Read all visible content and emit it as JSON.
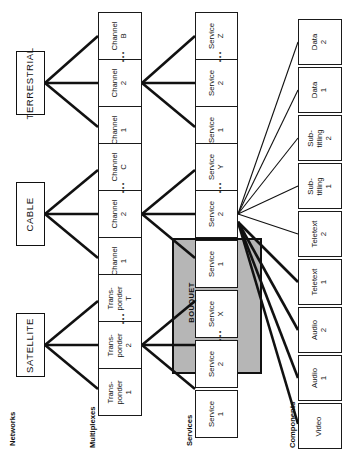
{
  "diagram": {
    "orientation": "rotated-90",
    "colors": {
      "line": "#111111",
      "box_fill": "#ffffff",
      "bouquet_fill": "#b6b6b6",
      "text": "#111111"
    }
  },
  "captions": [
    {
      "id": "networks",
      "label": "Networks"
    },
    {
      "id": "multiplexes",
      "label": "Multiplexes"
    },
    {
      "id": "services",
      "label": "Services"
    },
    {
      "id": "components",
      "label": "Components"
    }
  ],
  "bouquet": {
    "label": "BOUQUET"
  },
  "networks": [
    {
      "id": "terrestrial",
      "label": "TERRESTRIAL"
    },
    {
      "id": "cable",
      "label": "CABLE"
    },
    {
      "id": "satellite",
      "label": "SATELLITE"
    }
  ],
  "multiplexes": [
    {
      "id": "chan-b",
      "line1": "Channel",
      "line2": "B"
    },
    {
      "id": "chan-t2",
      "line1": "Channel",
      "line2": "2"
    },
    {
      "id": "chan-t1",
      "line1": "Channel",
      "line2": "1"
    },
    {
      "id": "chan-c",
      "line1": "Channel",
      "line2": "C"
    },
    {
      "id": "chan-c2",
      "line1": "Channel",
      "line2": "2"
    },
    {
      "id": "chan-c1",
      "line1": "Channel",
      "line2": "1"
    },
    {
      "id": "trans-t",
      "line1": "Trans-",
      "line2": "ponder",
      "line3": "T"
    },
    {
      "id": "trans-2",
      "line1": "Trans-",
      "line2": "ponder",
      "line3": "2"
    },
    {
      "id": "trans-1",
      "line1": "Trans-",
      "line2": "ponder",
      "line3": "1"
    }
  ],
  "services": [
    {
      "id": "svc-z",
      "line1": "Service",
      "line2": "Z"
    },
    {
      "id": "svc-t2",
      "line1": "Service",
      "line2": "2"
    },
    {
      "id": "svc-t1",
      "line1": "Service",
      "line2": "1"
    },
    {
      "id": "svc-y",
      "line1": "Service",
      "line2": "Y"
    },
    {
      "id": "svc-c2",
      "line1": "Service",
      "line2": "2"
    },
    {
      "id": "svc-c1",
      "line1": "Service",
      "line2": "1"
    },
    {
      "id": "svc-x",
      "line1": "Service",
      "line2": "X"
    },
    {
      "id": "svc-s2",
      "line1": "Service",
      "line2": "2"
    },
    {
      "id": "svc-s1",
      "line1": "Service",
      "line2": "1"
    }
  ],
  "components": [
    {
      "id": "data-2",
      "line1": "Data",
      "line2": "2"
    },
    {
      "id": "data-1",
      "line1": "Data",
      "line2": "1"
    },
    {
      "id": "subtit-2",
      "line1": "Sub-",
      "line2": "titling",
      "line3": "2"
    },
    {
      "id": "subtit-1",
      "line1": "Sub-",
      "line2": "titling",
      "line3": "1"
    },
    {
      "id": "teletext-2",
      "line1": "Teletext",
      "line2": "2"
    },
    {
      "id": "teletext-1",
      "line1": "Teletext",
      "line2": "1"
    },
    {
      "id": "audio-2",
      "line1": "Audio",
      "line2": "2"
    },
    {
      "id": "audio-1",
      "line1": "Audio",
      "line2": "1"
    },
    {
      "id": "video",
      "line1": "Video",
      "line2": ""
    }
  ],
  "ellipses": [
    {
      "id": "dots-mux-terrestrial",
      "label": "..."
    },
    {
      "id": "dots-mux-cable",
      "label": "..."
    },
    {
      "id": "dots-mux-satellite",
      "label": "..."
    },
    {
      "id": "dots-svc-terrestrial",
      "label": "..."
    },
    {
      "id": "dots-svc-cable",
      "label": "..."
    },
    {
      "id": "dots-svc-satellite",
      "label": "..."
    }
  ]
}
